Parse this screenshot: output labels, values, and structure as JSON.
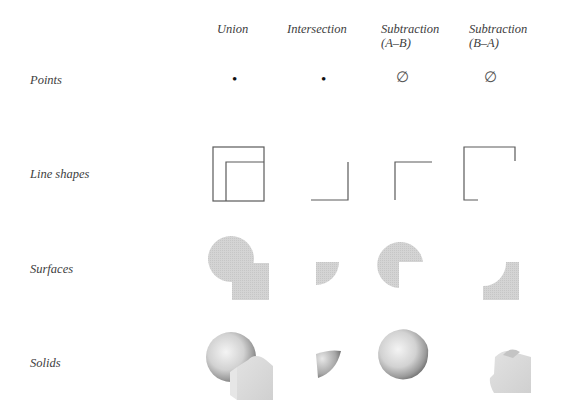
{
  "columns": [
    {
      "label": "Union"
    },
    {
      "label": "Intersection"
    },
    {
      "label": "Subtraction\n(A–B)"
    },
    {
      "label": "Subtraction\n(B–A)"
    }
  ],
  "rows": [
    {
      "label": "Points",
      "cells": [
        "•",
        "•",
        "∅",
        "∅"
      ]
    },
    {
      "label": "Line shapes",
      "cells": [
        "union-lines",
        "intersection-lines",
        "a-minus-b-lines",
        "b-minus-a-lines"
      ]
    },
    {
      "label": "Surfaces",
      "cells": [
        "union-surface",
        "intersection-surface",
        "a-minus-b-surface",
        "b-minus-a-surface"
      ]
    },
    {
      "label": "Solids",
      "cells": [
        "union-solid",
        "intersection-solid",
        "a-minus-b-solid",
        "b-minus-a-solid"
      ]
    }
  ],
  "colors": {
    "line": "#555555",
    "surface": "#cfcfcf",
    "text": "#3d3d3d"
  }
}
